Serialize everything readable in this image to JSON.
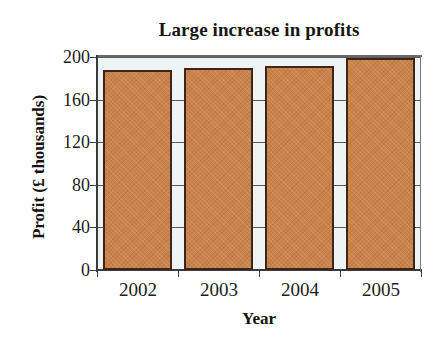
{
  "chart_data": {
    "type": "bar",
    "title": "Large increase in profits",
    "xlabel": "Year",
    "ylabel": "Profit (£ thousands)",
    "categories": [
      "2002",
      "2003",
      "2004",
      "2005"
    ],
    "values": [
      188,
      190,
      192,
      199
    ],
    "ylim": [
      0,
      200
    ],
    "ytick_labels": [
      "200",
      "160",
      "120",
      "80",
      "40",
      "0"
    ],
    "ytick_values": [
      200,
      160,
      120,
      80,
      40,
      0
    ],
    "grid": true,
    "grid_orientation": "horizontal",
    "legend": null,
    "bar_color": "#c8824a",
    "bar_border_color": "#40241a",
    "plot_background": "#eef3f5",
    "axis_color": "#3b3b3b",
    "text_color": "#221d1a"
  }
}
